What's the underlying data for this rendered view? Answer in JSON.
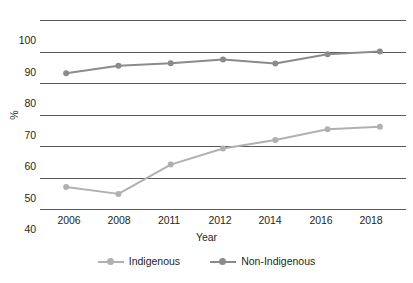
{
  "chart_data": {
    "type": "line",
    "title": "",
    "xlabel": "Year",
    "ylabel": "%",
    "categories": [
      "2006",
      "2008",
      "2011",
      "2012",
      "2014",
      "2016",
      "2018"
    ],
    "ylim": [
      40,
      100
    ],
    "yticks": [
      40,
      50,
      60,
      70,
      80,
      90,
      100
    ],
    "grid": true,
    "legend_position": "bottom",
    "series": [
      {
        "name": "Indigenous",
        "color": "#b0b0b0",
        "values": [
          47.0,
          44.8,
          54.1,
          59.2,
          61.9,
          65.3,
          66.1
        ]
      },
      {
        "name": "Non-Indigenous",
        "color": "#8b8b8b",
        "values": [
          83.1,
          85.5,
          86.3,
          87.5,
          86.2,
          89.1,
          90.0
        ]
      }
    ]
  },
  "axes": {
    "y_tick_labels": [
      "100",
      "90",
      "80",
      "70",
      "60",
      "50",
      "40"
    ],
    "y_axis_title": "%",
    "x_tick_labels": [
      "2006",
      "2008",
      "2011",
      "2012",
      "2014",
      "2016",
      "2018"
    ],
    "x_axis_title": "Year"
  },
  "legend": {
    "items": [
      {
        "label": "Indigenous",
        "color": "#b0b0b0"
      },
      {
        "label": "Non-Indigenous",
        "color": "#8b8b8b"
      }
    ]
  },
  "footnote": {
    "text": ""
  },
  "colors": {
    "gridline": "#58595b",
    "text": "#231f20",
    "indigenous": "#b0b0b0",
    "non_indigenous": "#8b8b8b"
  }
}
